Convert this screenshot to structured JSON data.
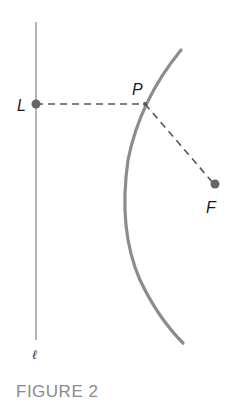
{
  "figure": {
    "caption": "FIGURE 2",
    "colors": {
      "curve": "#8c8c8c",
      "line": "#8c8c8c",
      "dash": "#555555",
      "dot": "#666666",
      "caption": "#8a8a8a"
    }
  },
  "line": {
    "label": "ℓ"
  },
  "points": {
    "L": {
      "label": "L"
    },
    "P": {
      "label": "P"
    },
    "F": {
      "label": "F"
    }
  }
}
